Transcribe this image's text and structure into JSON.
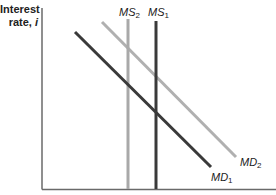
{
  "diagram": {
    "y_axis_label_line1": "Interest",
    "y_axis_label_line2": "rate, ",
    "y_axis_label_var": "i",
    "x_axis_label": "",
    "curves": [
      {
        "id": "MS2",
        "label": "MS",
        "sub": "2",
        "type": "vertical",
        "color": "#a9a9a9"
      },
      {
        "id": "MS1",
        "label": "MS",
        "sub": "1",
        "type": "vertical",
        "color": "#3a3a3a"
      },
      {
        "id": "MD1",
        "label": "MD",
        "sub": "1",
        "type": "downward-sloping",
        "color": "#3a3a3a"
      },
      {
        "id": "MD2",
        "label": "MD",
        "sub": "2",
        "type": "downward-sloping",
        "color": "#b0b0b0"
      }
    ],
    "colors": {
      "axis": "#6a6a6a",
      "dark": "#3a3a3a",
      "light": "#b0b0b0"
    }
  }
}
